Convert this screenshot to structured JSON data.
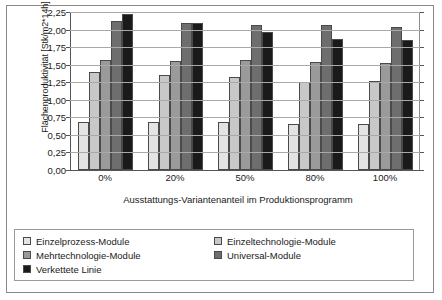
{
  "chart_data": {
    "type": "bar",
    "title": "",
    "xlabel": "Ausstattungs-Variantenanteil im Produktionsprogramm",
    "ylabel": "Flächenproduktivität [Stk/m2*14h]",
    "categories": [
      "0%",
      "20%",
      "50%",
      "80%",
      "100%"
    ],
    "ylim": [
      0,
      2.25
    ],
    "ytick_step": 0.25,
    "ytick_labels": [
      "2,25",
      "2,00",
      "1,75",
      "1,50",
      "1,25",
      "1,00",
      "0,75",
      "0,50",
      "0,25",
      "0,00"
    ],
    "ytick_values": [
      2.25,
      2.0,
      1.75,
      1.5,
      1.25,
      1.0,
      0.75,
      0.5,
      0.25,
      0.0
    ],
    "grid": "horizontal",
    "legend_position": "bottom",
    "series": [
      {
        "name": "Einzelprozess-Module",
        "color": "#e3e3e3",
        "values": [
          0.69,
          0.68,
          0.68,
          0.66,
          0.66
        ]
      },
      {
        "name": "Einzeltechnologie-Module",
        "color": "#c8c8c8",
        "values": [
          1.4,
          1.36,
          1.32,
          1.25,
          1.27
        ]
      },
      {
        "name": "Mehrtechnologie-Module",
        "color": "#9a9a9a",
        "values": [
          1.57,
          1.55,
          1.56,
          1.54,
          1.52
        ]
      },
      {
        "name": "Universal-Module",
        "color": "#6e6e6e",
        "values": [
          2.12,
          2.1,
          2.07,
          2.06,
          2.04
        ]
      },
      {
        "name": "Verkettete Linie",
        "color": "#1a1a1a",
        "values": [
          2.22,
          2.1,
          1.97,
          1.86,
          1.85
        ]
      }
    ]
  }
}
